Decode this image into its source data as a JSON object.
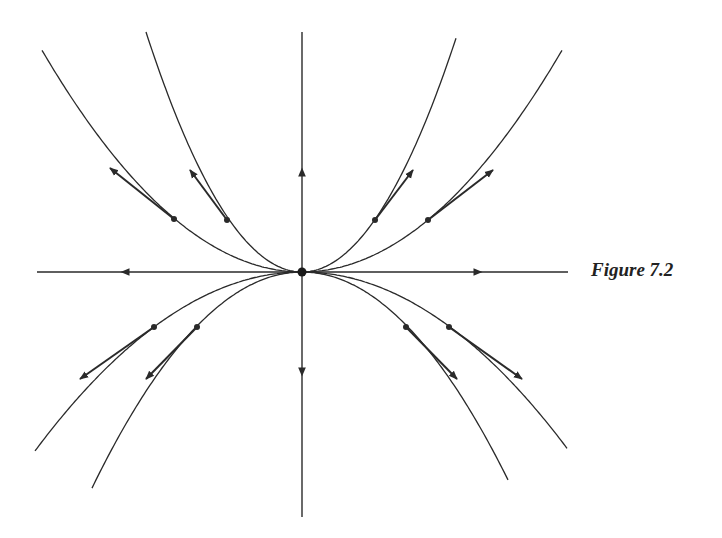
{
  "figure": {
    "caption": "Figure 7.2",
    "type": "phase portrait",
    "colors": {
      "ink": "#2a2a2a",
      "background": "#ffffff"
    },
    "origin": {
      "x": 302,
      "y": 272
    },
    "axes": {
      "horizontal": {
        "x1": 37,
        "x2": 568,
        "y": 272,
        "arrows": [
          {
            "at": 125,
            "dir": "left"
          },
          {
            "at": 478,
            "dir": "right"
          }
        ]
      },
      "vertical": {
        "x": 302,
        "y1": 32,
        "y2": 517,
        "arrows": [
          {
            "at": 172,
            "dir": "up"
          },
          {
            "at": 372,
            "dir": "down"
          }
        ]
      }
    },
    "trajectories": [
      {
        "name": "upper-outer",
        "k": -0.00328,
        "xmin": 42,
        "xmax": 562
      },
      {
        "name": "upper-inner",
        "k": -0.00986,
        "xmin": 146,
        "xmax": 457
      },
      {
        "name": "lower-outer",
        "k": 0.00251,
        "xmin": 35,
        "xmax": 567
      },
      {
        "name": "lower-inner",
        "k": 0.0049,
        "xmin": 92,
        "xmax": 509
      }
    ],
    "tangent_vectors": [
      {
        "from": [
          174,
          219
        ],
        "to": [
          110,
          168
        ]
      },
      {
        "from": [
          227,
          220
        ],
        "to": [
          190,
          170
        ]
      },
      {
        "from": [
          375,
          220
        ],
        "to": [
          413,
          170
        ]
      },
      {
        "from": [
          428,
          220
        ],
        "to": [
          493,
          170
        ]
      },
      {
        "from": [
          154,
          327
        ],
        "to": [
          80,
          379
        ]
      },
      {
        "from": [
          197,
          327
        ],
        "to": [
          146,
          379
        ]
      },
      {
        "from": [
          406,
          327
        ],
        "to": [
          457,
          379
        ]
      },
      {
        "from": [
          449,
          327
        ],
        "to": [
          522,
          379
        ]
      }
    ]
  }
}
